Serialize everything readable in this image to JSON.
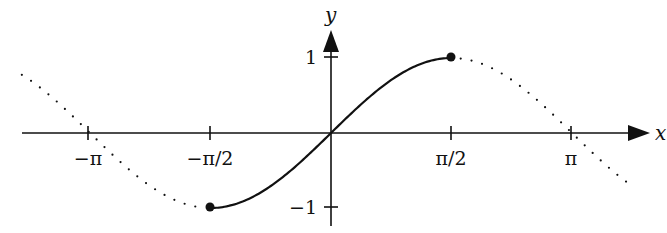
{
  "figure": {
    "title": "",
    "colors": {
      "ink": "#111111",
      "background": "#ffffff"
    }
  },
  "axes": {
    "x_label": "x",
    "y_label": "y",
    "x_ticks": [
      {
        "label": "−π",
        "value": -3.14159
      },
      {
        "label": "−π/2",
        "value": -1.5708
      },
      {
        "label": "π/2",
        "value": 1.5708
      },
      {
        "label": "π",
        "value": 3.14159
      }
    ],
    "y_ticks": [
      {
        "label": "1",
        "value": 1
      },
      {
        "label": "−1",
        "value": -1
      }
    ]
  },
  "chart_data": {
    "type": "line",
    "title": "",
    "xlabel": "x",
    "ylabel": "y",
    "xlim": [
      -4.03,
      4.16
    ],
    "ylim": [
      -1.25,
      1.35
    ],
    "grid": false,
    "legend": null,
    "series": [
      {
        "name": "sin x on [-pi/2, pi/2]",
        "style": "solid",
        "function": "sin(x)",
        "x_range": [
          -1.5708,
          1.5708
        ],
        "endpoints": [
          {
            "x": -1.5708,
            "y": -1,
            "marker": "filled-dot"
          },
          {
            "x": 1.5708,
            "y": 1,
            "marker": "filled-dot"
          }
        ]
      },
      {
        "name": "sin x (rest of curve)",
        "style": "dotted",
        "function": "sin(x)",
        "x_ranges": [
          [
            -4.03,
            -1.5708
          ],
          [
            1.5708,
            3.95
          ]
        ]
      }
    ]
  }
}
